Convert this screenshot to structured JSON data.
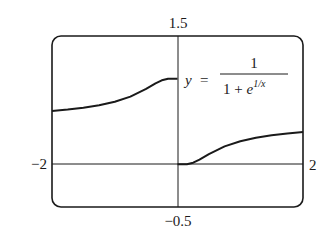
{
  "chart_data": {
    "type": "line",
    "title": "",
    "function_label": {
      "lhs": "y",
      "equals": "=",
      "numerator": "1",
      "denominator_prefix": "1 + ",
      "denominator_base": "e",
      "denominator_exponent": "1/x"
    },
    "xlabel": "",
    "ylabel": "",
    "xlim": [
      -2,
      2
    ],
    "ylim": [
      -0.5,
      1.5
    ],
    "tick_labels": {
      "x_min": "−2",
      "x_max": "2",
      "y_min": "−0.5",
      "y_max": "1.5"
    },
    "grid": false,
    "legend": null,
    "series": [
      {
        "name": "y = 1/(1+e^(1/x)), x<0",
        "x": [
          -2,
          -1.75,
          -1.5,
          -1.25,
          -1,
          -0.75,
          -0.5,
          -0.35,
          -0.25,
          -0.15,
          -0.1,
          -0.05,
          0
        ],
        "y": [
          0.622,
          0.639,
          0.661,
          0.69,
          0.731,
          0.791,
          0.881,
          0.946,
          0.982,
          0.999,
          1.0,
          1.0,
          1.0
        ]
      },
      {
        "name": "y = 1/(1+e^(1/x)), x>0",
        "x": [
          0,
          0.05,
          0.1,
          0.15,
          0.25,
          0.35,
          0.5,
          0.75,
          1,
          1.25,
          1.5,
          1.75,
          2
        ],
        "y": [
          0.0,
          0.0,
          0.0,
          0.001,
          0.018,
          0.054,
          0.119,
          0.209,
          0.269,
          0.31,
          0.339,
          0.361,
          0.378
        ]
      }
    ]
  },
  "colors": {
    "line": "#1a1a1a",
    "frame": "#1a1a1a",
    "axis": "#1a1a1a",
    "background": "#ffffff"
  }
}
